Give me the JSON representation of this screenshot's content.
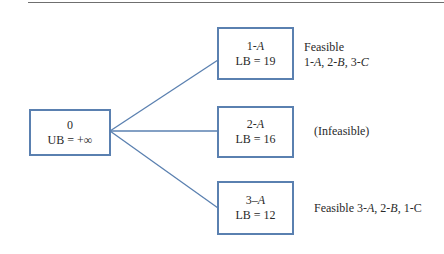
{
  "colors": {
    "box_border": "#5a80b0",
    "edge": "#5a80b0",
    "rule": "#6f6f6f"
  },
  "root": {
    "label": "0",
    "bound": "UB = +∞"
  },
  "children": [
    {
      "id": "1A",
      "num": "1-",
      "letter": "A",
      "bound": "LB = 19",
      "note_line1": "Feasible",
      "note_line2": "1-A, 2-B, 3-C"
    },
    {
      "id": "2A",
      "num": "2-",
      "letter": "A",
      "bound": "LB = 16",
      "note_line1": "(Infeasible)"
    },
    {
      "id": "3A",
      "num": "3–",
      "letter": "A",
      "bound": "LB = 12",
      "note_line1": "Feasible 3-A, 2-B, 1-C"
    }
  ]
}
